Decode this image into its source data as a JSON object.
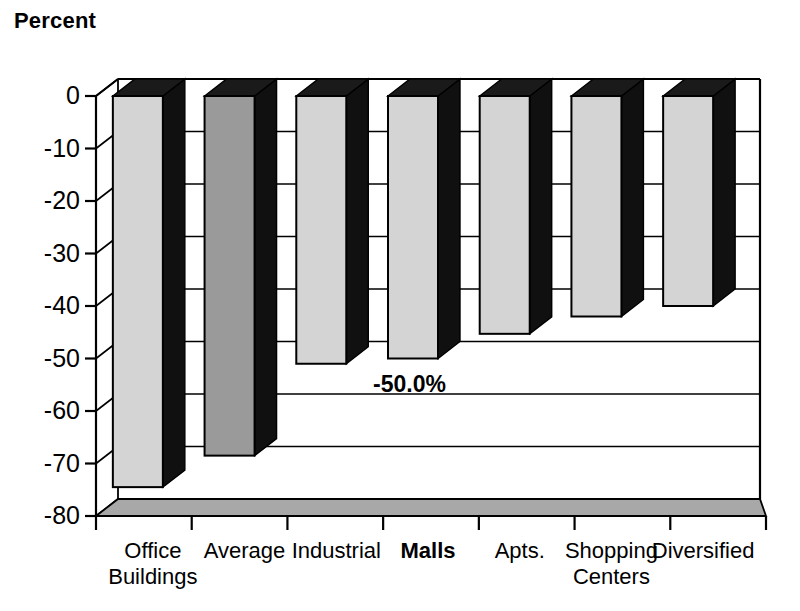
{
  "chart_data": {
    "type": "bar",
    "title": "Percent",
    "subtitle": "",
    "xlabel": "",
    "ylabel": "Percent",
    "ylim": [
      -80,
      0
    ],
    "ytick_step": 10,
    "yticks": [
      "0",
      "-10",
      "-20",
      "-30",
      "-40",
      "-50",
      "-60",
      "-70",
      "-80"
    ],
    "grid": true,
    "legend": "none",
    "style": "3d-column",
    "categories": [
      "Office Buildings",
      "Average",
      "Industrial",
      "Malls",
      "Apts.",
      "Shopping Centers",
      "Diversified"
    ],
    "category_lines": [
      [
        "Office",
        "Buildings"
      ],
      [
        "Average",
        ""
      ],
      [
        "Industrial",
        ""
      ],
      [
        "Malls",
        ""
      ],
      [
        "Apts.",
        ""
      ],
      [
        "Shopping",
        "Centers"
      ],
      [
        "Diversified",
        ""
      ]
    ],
    "values": [
      -74.5,
      -68.5,
      -51.0,
      -50.0,
      -45.3,
      -42.0,
      -40.0
    ],
    "highlight_category": "Malls",
    "emphasis_category": "Average",
    "data_labels": [
      {
        "category": "Malls",
        "text": "-50.0%"
      }
    ],
    "bar_colors": {
      "default_face": "#d4d4d4",
      "emphasis_face": "#9a9a9a",
      "side_face": "#101010",
      "top_face": "#1a1a1a",
      "outline": "#000000"
    },
    "floor_color": "#a8a8a8",
    "axis_color": "#000000",
    "grid_color": "#000000",
    "background": "#ffffff"
  }
}
